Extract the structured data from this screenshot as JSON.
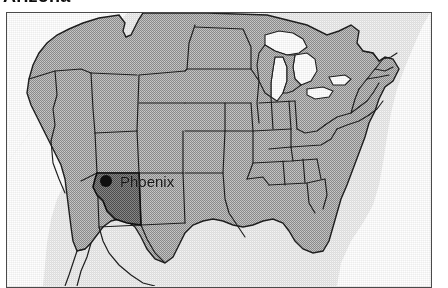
{
  "page": {
    "title": "Arizona",
    "title_clipped": true,
    "background_color": "#ffffff"
  },
  "map": {
    "name": "united-states-locator-map",
    "frame_border_color": "#4a4a4a",
    "ocean_color": "#ffffff",
    "land_fill_color": "#a8a8a8",
    "plate_background_color": "#f2f2f2",
    "state_outline_color": "#1a1a1a",
    "highlight": {
      "state": "Arizona",
      "fill_color": "#6e6e6e"
    },
    "city_marker": {
      "label": "Phoenix",
      "marker_color": "#111111",
      "marker_shape": "filled-circle"
    },
    "region_label": "Contiguous United States"
  },
  "icons": {
    "city_dot": "city-dot-icon"
  }
}
